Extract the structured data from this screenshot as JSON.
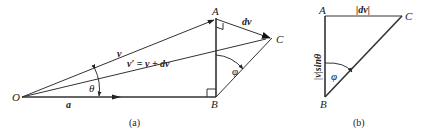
{
  "figure_a": {
    "caption": "(a)",
    "points": {
      "O": "O",
      "A": "A",
      "B": "B",
      "C": "C"
    },
    "vectors": {
      "v": "v",
      "v_prime": "v′ = v + dv",
      "a": "a",
      "dv": "dv"
    },
    "angles": {
      "theta": "θ",
      "phi": "φ"
    }
  },
  "figure_b": {
    "caption": "(b)",
    "points": {
      "A": "A",
      "B": "B",
      "C": "C"
    },
    "labels": {
      "top": "|dv|",
      "left": "|v|sinθ"
    },
    "angles": {
      "phi": "φ"
    }
  },
  "colors": {
    "line": "#333333",
    "text": "#222222",
    "background": "#ffffff"
  }
}
